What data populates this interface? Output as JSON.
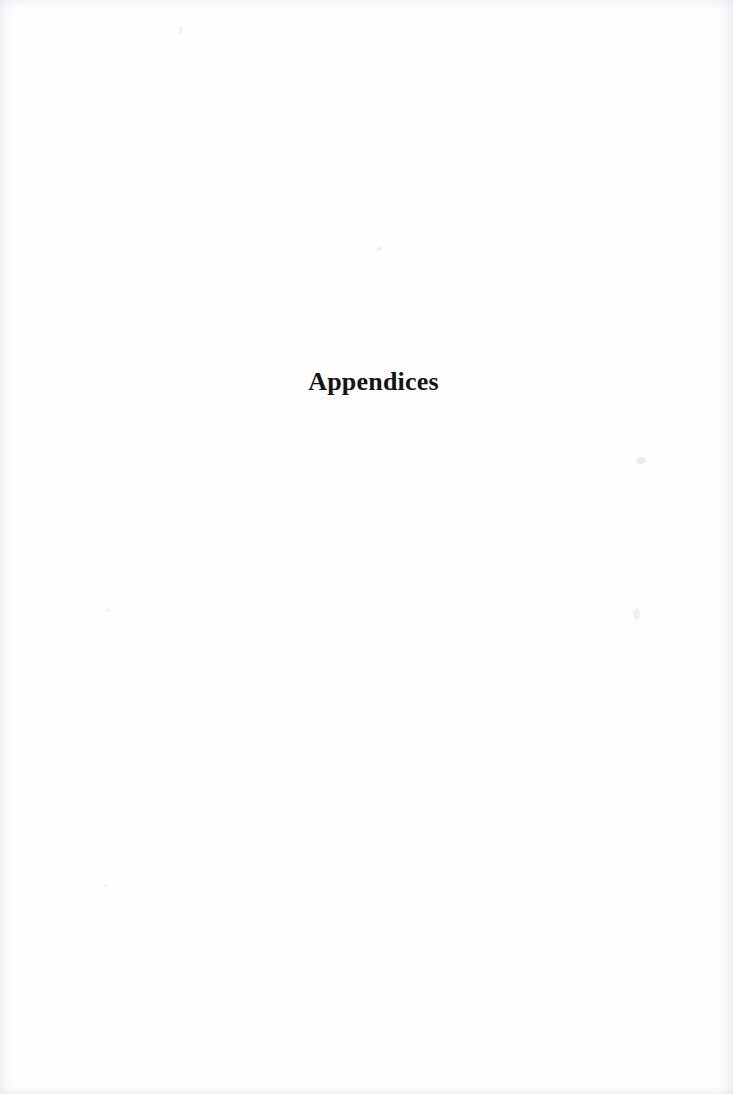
{
  "document": {
    "type": "scanned-book-page",
    "page_kind": "section-divider",
    "background_color": "#ffffff",
    "text_color": "#141414"
  },
  "content": {
    "section_title": "Appendices"
  },
  "artifacts": {
    "edge_shading": "scan-gutter-shadow",
    "speck_label": "scan-speck"
  }
}
